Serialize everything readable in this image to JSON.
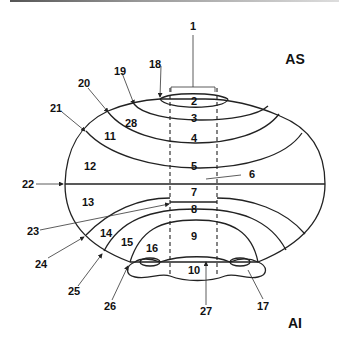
{
  "diagram": {
    "corner_labels": {
      "top_right": "AS",
      "bottom_right": "AI"
    },
    "region_labels": [
      "2",
      "3",
      "4",
      "5",
      "7",
      "8",
      "9",
      "10",
      "11",
      "12",
      "13",
      "14",
      "15",
      "16",
      "28"
    ],
    "callout_labels": [
      "1",
      "6",
      "17",
      "18",
      "19",
      "20",
      "21",
      "22",
      "23",
      "24",
      "25",
      "26",
      "27"
    ],
    "labels": {
      "l1": "1",
      "l2": "2",
      "l3": "3",
      "l4": "4",
      "l5": "5",
      "l6": "6",
      "l7": "7",
      "l8": "8",
      "l9": "9",
      "l10": "10",
      "l11": "11",
      "l12": "12",
      "l13": "13",
      "l14": "14",
      "l15": "15",
      "l16": "16",
      "l17": "17",
      "l18": "18",
      "l19": "19",
      "l20": "20",
      "l21": "21",
      "l22": "22",
      "l23": "23",
      "l24": "24",
      "l25": "25",
      "l26": "26",
      "l27": "27",
      "l28": "28",
      "as": "AS",
      "ai": "AI"
    },
    "colors": {
      "line": "#222222",
      "background": "#ffffff"
    }
  }
}
